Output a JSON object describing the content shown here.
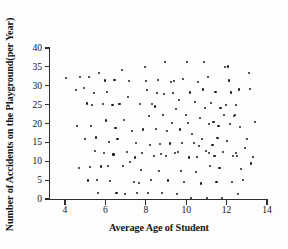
{
  "chart_data": {
    "type": "scatter",
    "title": "",
    "xlabel": "Average Age of Student",
    "ylabel": "Number of Accidents on the Playground(per Year)",
    "xlim": [
      3.4,
      14.2
    ],
    "ylim": [
      0,
      40.8
    ],
    "xticks": [
      4,
      6,
      8,
      10,
      12,
      14
    ],
    "yticks": [
      0,
      5,
      10,
      15,
      20,
      25,
      30,
      35,
      40
    ],
    "xtick_labels": [
      "4",
      "6",
      "8",
      "10",
      "12",
      "14"
    ],
    "ytick_labels": [
      "0",
      "5",
      "10",
      "15",
      "20",
      "25",
      "30",
      "35",
      "40"
    ],
    "grid": false,
    "legend": false,
    "marker": "dot",
    "marker_color": "#1d1d1d",
    "axis_color": "#2e2e2e",
    "n_points": 150,
    "points": [
      [
        4.05,
        32.0
      ],
      [
        4.55,
        28.8
      ],
      [
        4.6,
        19.3
      ],
      [
        4.7,
        8.1
      ],
      [
        4.75,
        32.4
      ],
      [
        4.95,
        29.3
      ],
      [
        5.0,
        15.8
      ],
      [
        5.1,
        25.3
      ],
      [
        5.15,
        4.9
      ],
      [
        5.2,
        32.3
      ],
      [
        5.25,
        8.5
      ],
      [
        5.3,
        19.4
      ],
      [
        5.45,
        28.0
      ],
      [
        5.5,
        12.6
      ],
      [
        5.55,
        16.3
      ],
      [
        5.6,
        5.1
      ],
      [
        5.65,
        1.7
      ],
      [
        5.7,
        33.3
      ],
      [
        5.8,
        8.6
      ],
      [
        5.9,
        25.2
      ],
      [
        5.95,
        12.3
      ],
      [
        6.0,
        31.4
      ],
      [
        6.05,
        20.8
      ],
      [
        6.1,
        28.4
      ],
      [
        6.2,
        15.2
      ],
      [
        6.25,
        4.8
      ],
      [
        6.35,
        24.8
      ],
      [
        6.4,
        11.8
      ],
      [
        6.5,
        18.9
      ],
      [
        6.55,
        1.6
      ],
      [
        6.6,
        15.8
      ],
      [
        6.7,
        25.2
      ],
      [
        6.8,
        34.1
      ],
      [
        6.85,
        8.7
      ],
      [
        6.9,
        21.0
      ],
      [
        6.95,
        1.3
      ],
      [
        7.05,
        12.5
      ],
      [
        7.1,
        26.9
      ],
      [
        7.15,
        31.3
      ],
      [
        7.2,
        9.9
      ],
      [
        7.3,
        18.0
      ],
      [
        7.4,
        4.4
      ],
      [
        7.5,
        14.9
      ],
      [
        7.55,
        1.7
      ],
      [
        7.7,
        25.1
      ],
      [
        7.75,
        7.6
      ],
      [
        7.8,
        12.3
      ],
      [
        7.85,
        18.4
      ],
      [
        7.95,
        35.0
      ],
      [
        8.0,
        31.2
      ],
      [
        8.05,
        28.8
      ],
      [
        8.1,
        1.6
      ],
      [
        8.15,
        21.9
      ],
      [
        8.2,
        14.4
      ],
      [
        8.25,
        5.0
      ],
      [
        8.3,
        25.2
      ],
      [
        8.4,
        11.4
      ],
      [
        8.5,
        18.6
      ],
      [
        8.55,
        28.0
      ],
      [
        8.6,
        31.6
      ],
      [
        8.65,
        7.5
      ],
      [
        8.7,
        14.6
      ],
      [
        8.8,
        1.7
      ],
      [
        8.85,
        22.2
      ],
      [
        8.9,
        27.8
      ],
      [
        8.95,
        36.2
      ],
      [
        9.0,
        11.4
      ],
      [
        9.05,
        18.0
      ],
      [
        9.1,
        4.9
      ],
      [
        9.2,
        14.7
      ],
      [
        9.3,
        20.2
      ],
      [
        9.35,
        28.0
      ],
      [
        9.4,
        31.2
      ],
      [
        9.45,
        12.3
      ],
      [
        9.5,
        23.8
      ],
      [
        9.55,
        1.3
      ],
      [
        9.6,
        12.4
      ],
      [
        9.65,
        26.2
      ],
      [
        9.7,
        18.4
      ],
      [
        9.75,
        7.4
      ],
      [
        9.8,
        14.8
      ],
      [
        9.9,
        4.5
      ],
      [
        10.0,
        22.3
      ],
      [
        10.05,
        36.3
      ],
      [
        10.1,
        20.2
      ],
      [
        10.15,
        11.0
      ],
      [
        10.2,
        28.2
      ],
      [
        10.25,
        0.2
      ],
      [
        10.3,
        17.2
      ],
      [
        10.4,
        14.9
      ],
      [
        10.45,
        25.8
      ],
      [
        10.5,
        7.2
      ],
      [
        10.55,
        11.2
      ],
      [
        10.6,
        31.0
      ],
      [
        10.7,
        21.5
      ],
      [
        10.75,
        4.1
      ],
      [
        10.8,
        16.0
      ],
      [
        10.85,
        29.0
      ],
      [
        10.9,
        36.4
      ],
      [
        10.95,
        24.1
      ],
      [
        11.0,
        12.7
      ],
      [
        11.05,
        0.2
      ],
      [
        11.1,
        32.3
      ],
      [
        11.15,
        19.8
      ],
      [
        11.2,
        8.8
      ],
      [
        11.25,
        25.5
      ],
      [
        11.3,
        14.2
      ],
      [
        11.35,
        20.4
      ],
      [
        11.4,
        11.4
      ],
      [
        11.45,
        28.3
      ],
      [
        11.5,
        4.4
      ],
      [
        11.55,
        16.2
      ],
      [
        11.6,
        19.3
      ],
      [
        11.65,
        8.1
      ],
      [
        11.7,
        24.0
      ],
      [
        11.75,
        0.2
      ],
      [
        11.8,
        12.5
      ],
      [
        11.85,
        22.2
      ],
      [
        11.9,
        34.9
      ],
      [
        11.95,
        25.0
      ],
      [
        12.0,
        15.4
      ],
      [
        12.05,
        35.1
      ],
      [
        12.1,
        31.4
      ],
      [
        12.15,
        19.9
      ],
      [
        12.2,
        28.2
      ],
      [
        12.25,
        4.6
      ],
      [
        12.3,
        11.4
      ],
      [
        12.35,
        21.9
      ],
      [
        12.4,
        22.2
      ],
      [
        12.45,
        12.3
      ],
      [
        12.5,
        11.3
      ],
      [
        12.55,
        1.3
      ],
      [
        12.6,
        29.0
      ],
      [
        12.65,
        19.0
      ],
      [
        12.7,
        8.0
      ],
      [
        12.8,
        5.0
      ],
      [
        12.9,
        13.6
      ],
      [
        13.0,
        16.0
      ],
      [
        13.1,
        33.4
      ],
      [
        13.15,
        29.1
      ],
      [
        13.2,
        9.4
      ],
      [
        13.4,
        20.5
      ],
      [
        7.45,
        11.0
      ],
      [
        8.45,
        24.5
      ],
      [
        9.25,
        31.0
      ],
      [
        6.15,
        8.8
      ],
      [
        5.35,
        25.0
      ],
      [
        10.65,
        14.0
      ],
      [
        11.15,
        12.2
      ],
      [
        12.45,
        25.0
      ],
      [
        13.3,
        11.2
      ],
      [
        9.85,
        31.8
      ],
      [
        7.65,
        4.3
      ],
      [
        6.45,
        31.5
      ],
      [
        8.75,
        12.0
      ]
    ]
  },
  "axes": {
    "x_title": "Average Age of Student",
    "y_title": "Number of Accidents on the Playground(per Year)"
  }
}
